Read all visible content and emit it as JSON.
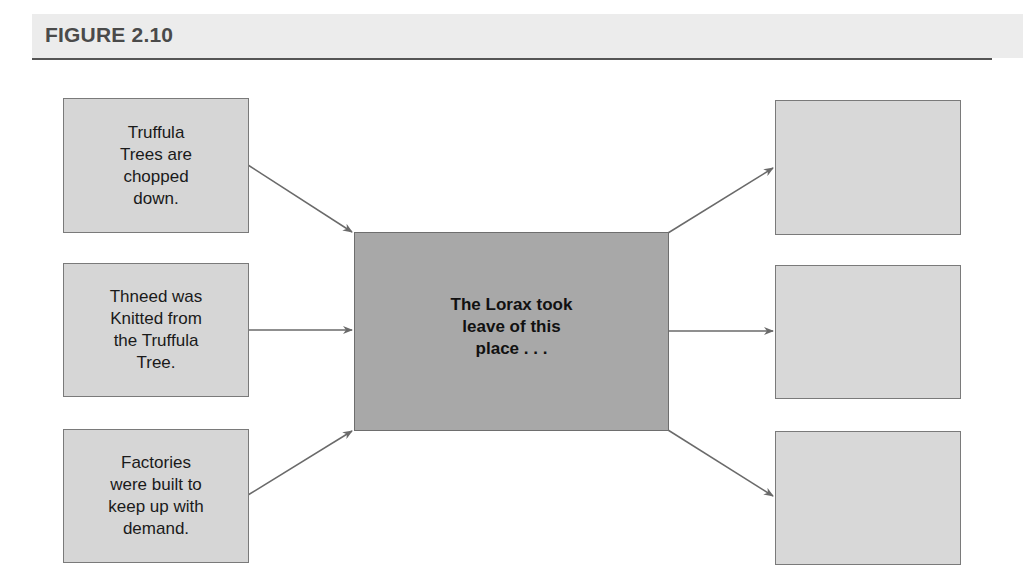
{
  "figure": {
    "title": "FIGURE 2.10"
  },
  "diagram": {
    "type": "cause-effect",
    "causes": [
      {
        "id": "cause-1",
        "text": "Truffula\nTrees are\nchopped\ndown."
      },
      {
        "id": "cause-2",
        "text": "Thneed was\nKnitted from\nthe Truffula\nTree."
      },
      {
        "id": "cause-3",
        "text": "Factories\nwere built to\nkeep up with\ndemand."
      }
    ],
    "center": {
      "id": "event",
      "text": "The Lorax took\nleave of this\nplace . . ."
    },
    "effects": [
      {
        "id": "effect-1",
        "text": ""
      },
      {
        "id": "effect-2",
        "text": ""
      },
      {
        "id": "effect-3",
        "text": ""
      }
    ],
    "colors": {
      "cause_box": "#d6d6d6",
      "center_box": "#a8a8a8",
      "effect_box": "#d8d8d8",
      "arrow": "#6a6a6a",
      "title_band": "#ececec",
      "title_text": "#4a4a4a"
    }
  }
}
